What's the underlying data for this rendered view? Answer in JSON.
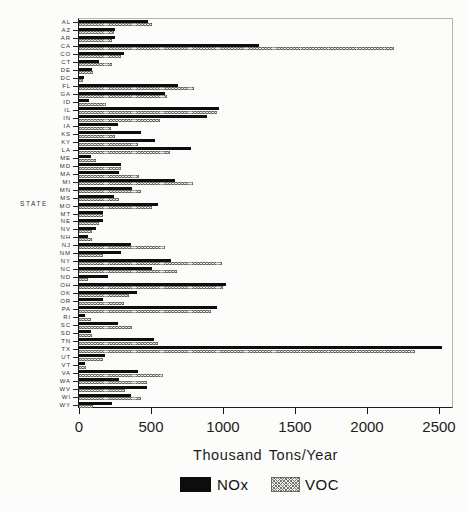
{
  "colors": {
    "nox_bar": "#0d0d0d",
    "voc_fill": "#efeeea",
    "voc_hatch": "#75736d",
    "axis": "#1a1a1a",
    "frame": "#b4b4b0",
    "background": "#fcfcfa"
  },
  "chart_data": {
    "type": "bar",
    "orientation": "horizontal",
    "title": "",
    "xlabel": "Thousand Tons/Year",
    "ylabel": "STATE",
    "xlim": [
      0,
      2500
    ],
    "x_ticks": [
      0,
      500,
      1000,
      1500,
      2000,
      2500
    ],
    "grid": false,
    "legend_position": "bottom",
    "legend": [
      {
        "name": "NOx",
        "style": "solid-black"
      },
      {
        "name": "VOC",
        "style": "crosshatch"
      }
    ],
    "categories": [
      "AL",
      "AZ",
      "AR",
      "CA",
      "CO",
      "CT",
      "DE",
      "DC",
      "FL",
      "GA",
      "ID",
      "IL",
      "IN",
      "IA",
      "KS",
      "KY",
      "LA",
      "ME",
      "MD",
      "MA",
      "MI",
      "MN",
      "MS",
      "MO",
      "MT",
      "NE",
      "NV",
      "NH",
      "NJ",
      "NM",
      "NY",
      "NC",
      "ND",
      "OH",
      "OK",
      "OR",
      "PA",
      "RI",
      "SC",
      "SD",
      "TN",
      "TX",
      "UT",
      "VT",
      "VA",
      "WA",
      "WV",
      "WI",
      "WY"
    ],
    "series": [
      {
        "name": "NOx",
        "values": [
          480,
          250,
          250,
          1250,
          310,
          140,
          90,
          35,
          690,
          600,
          70,
          970,
          890,
          270,
          430,
          530,
          780,
          80,
          290,
          280,
          670,
          370,
          240,
          550,
          170,
          170,
          120,
          60,
          360,
          290,
          640,
          510,
          200,
          1020,
          400,
          170,
          960,
          40,
          270,
          80,
          520,
          2520,
          180,
          40,
          410,
          280,
          470,
          360,
          230
        ]
      },
      {
        "name": "VOC",
        "values": [
          510,
          240,
          230,
          2190,
          290,
          230,
          100,
          25,
          800,
          610,
          190,
          960,
          560,
          220,
          250,
          410,
          630,
          120,
          290,
          420,
          790,
          430,
          280,
          510,
          170,
          140,
          90,
          90,
          600,
          170,
          990,
          680,
          60,
          1000,
          350,
          310,
          920,
          80,
          370,
          90,
          550,
          2330,
          170,
          50,
          580,
          470,
          320,
          430,
          100
        ]
      }
    ]
  }
}
